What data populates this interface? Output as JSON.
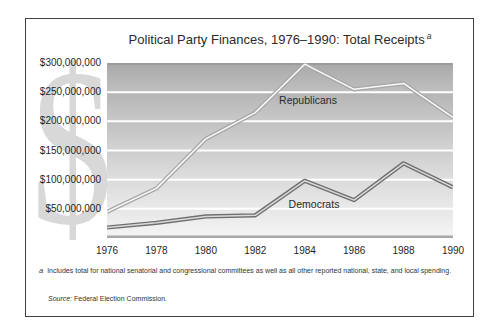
{
  "figure": {
    "title": "Political Party Finances, 1976–1990: Total Receipts",
    "title_footnote_marker": "a",
    "watermark_glyph": "$"
  },
  "chart_data": {
    "type": "line",
    "title": "Political Party Finances, 1976–1990: Total Receipts",
    "x_years": [
      1976,
      1978,
      1980,
      1982,
      1984,
      1986,
      1988,
      1990
    ],
    "x_tick_labels": [
      "1976",
      "1978",
      "1980",
      "1982",
      "1984",
      "1986",
      "1988",
      "1990"
    ],
    "y_tick_labels": [
      "$300,000,000",
      "$250,000,000",
      "$200,000,000",
      "$150,000,000",
      "$100,000,000",
      "$50,000,000"
    ],
    "y_tick_values_millions": [
      300,
      250,
      200,
      150,
      100,
      50
    ],
    "ylim_millions": [
      0,
      300
    ],
    "grid": "horizontal white gridlines over gray gradient bands",
    "legend": "inline labels beside lines",
    "series": [
      {
        "name": "Republicans",
        "values_millions": [
          45,
          85,
          170,
          215,
          298,
          255,
          265,
          207
        ],
        "line_outer_color": "#a8a8a8",
        "line_inner_color": "#fafafa"
      },
      {
        "name": "Democrats",
        "values_millions": [
          18,
          26,
          37,
          39,
          98,
          65,
          128,
          87
        ],
        "line_outer_color": "#6e6e6e",
        "line_inner_color": "#d9d9d9"
      }
    ]
  },
  "footnote": {
    "marker": "a",
    "text": "Includes total for national senatorial and congressional committees as well as all other reported national, state, and local spending.",
    "source_label": "Source:",
    "source_text": " Federal Election Commission."
  },
  "colors": {
    "frame_border": "#404040",
    "background": "#ffffff",
    "watermark": "#d8d8d8",
    "plot_top_line": "#9c9c9c",
    "axis_line": "#a8a8a8",
    "gridline": "#ffffff",
    "text": "#2b2b2b",
    "bands": [
      {
        "top": "#a9a9a9",
        "bottom": "#bfbfbf"
      },
      {
        "top": "#b4b4b4",
        "bottom": "#c9c9c9"
      },
      {
        "top": "#c0c0c0",
        "bottom": "#d4d4d4"
      },
      {
        "top": "#cdcdcd",
        "bottom": "#dfdfdf"
      },
      {
        "top": "#dadada",
        "bottom": "#eaeaea"
      },
      {
        "top": "#e7e7e7",
        "bottom": "#f5f5f5"
      }
    ]
  }
}
